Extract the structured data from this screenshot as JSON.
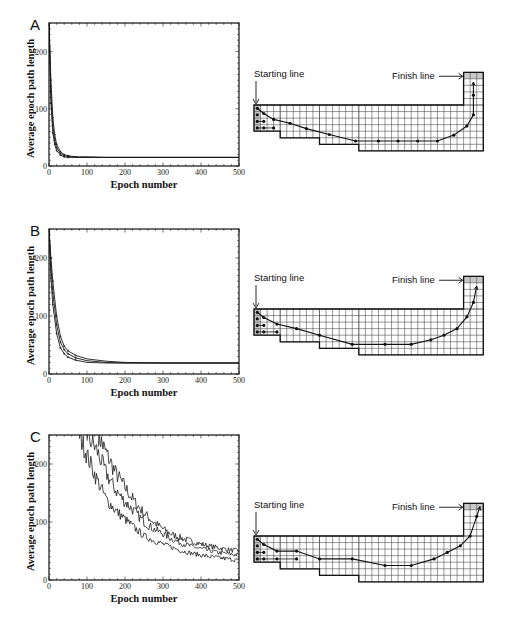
{
  "figure": {
    "panels": [
      {
        "letter": "A",
        "start_label": "Starting line",
        "finish_label": "Finish line"
      },
      {
        "letter": "B",
        "start_label": "Starting line",
        "finish_label": "Finish line"
      },
      {
        "letter": "C",
        "start_label": "Starting line",
        "finish_label": "Finish line"
      }
    ]
  },
  "chart_data": [
    {
      "type": "line",
      "panel": "A",
      "title": "",
      "xlabel": "Epoch number",
      "ylabel": "Average epoch path length",
      "xlim": [
        0,
        500
      ],
      "ylim": [
        0,
        250
      ],
      "xticks": [
        0,
        100,
        200,
        300,
        400,
        500
      ],
      "yticks": [
        0,
        100,
        200
      ],
      "grid": false,
      "series": [
        {
          "name": "upper",
          "x": [
            0,
            5,
            10,
            15,
            20,
            30,
            40,
            50,
            60,
            80,
            100,
            150,
            200,
            300,
            400,
            500
          ],
          "y": [
            250,
            150,
            85,
            55,
            38,
            25,
            20,
            18,
            17,
            16,
            16,
            15,
            15,
            15,
            15,
            15
          ]
        },
        {
          "name": "middle",
          "x": [
            0,
            5,
            10,
            15,
            20,
            30,
            40,
            50,
            60,
            80,
            100,
            150,
            200,
            300,
            400,
            500
          ],
          "y": [
            250,
            130,
            70,
            45,
            32,
            22,
            18,
            17,
            16,
            15,
            15,
            15,
            15,
            15,
            15,
            15
          ]
        },
        {
          "name": "lower",
          "x": [
            0,
            5,
            10,
            15,
            20,
            30,
            40,
            50,
            60,
            80,
            100,
            150,
            200,
            300,
            400,
            500
          ],
          "y": [
            250,
            110,
            58,
            38,
            27,
            19,
            16,
            15,
            15,
            15,
            15,
            15,
            15,
            15,
            15,
            15
          ]
        }
      ]
    },
    {
      "type": "line",
      "panel": "B",
      "title": "",
      "xlabel": "Epoch number",
      "ylabel": "Average epoch path length",
      "xlim": [
        0,
        500
      ],
      "ylim": [
        0,
        250
      ],
      "xticks": [
        0,
        100,
        200,
        300,
        400,
        500
      ],
      "yticks": [
        0,
        100,
        200
      ],
      "grid": false,
      "series": [
        {
          "name": "upper",
          "x": [
            0,
            5,
            10,
            20,
            30,
            40,
            50,
            70,
            100,
            150,
            200,
            300,
            400,
            500
          ],
          "y": [
            250,
            200,
            160,
            100,
            65,
            48,
            40,
            32,
            26,
            22,
            20,
            19,
            19,
            19
          ]
        },
        {
          "name": "middle",
          "x": [
            0,
            5,
            10,
            20,
            30,
            40,
            50,
            70,
            100,
            150,
            200,
            300,
            400,
            500
          ],
          "y": [
            250,
            185,
            140,
            85,
            55,
            42,
            35,
            28,
            23,
            20,
            19,
            19,
            19,
            19
          ]
        },
        {
          "name": "lower",
          "x": [
            0,
            5,
            10,
            20,
            30,
            40,
            50,
            70,
            100,
            150,
            200,
            300,
            400,
            500
          ],
          "y": [
            250,
            165,
            120,
            70,
            45,
            35,
            29,
            24,
            20,
            19,
            19,
            19,
            19,
            19
          ]
        }
      ]
    },
    {
      "type": "line",
      "panel": "C",
      "title": "",
      "xlabel": "Epoch number",
      "ylabel": "Average epoch path length",
      "xlim": [
        0,
        500
      ],
      "ylim": [
        0,
        250
      ],
      "xticks": [
        0,
        100,
        200,
        300,
        400,
        500
      ],
      "yticks": [
        0,
        100,
        200
      ],
      "grid": false,
      "series": [
        {
          "name": "upper",
          "x": [
            130,
            150,
            175,
            200,
            225,
            250,
            275,
            300,
            325,
            350,
            375,
            400,
            425,
            450,
            475,
            500
          ],
          "y": [
            250,
            220,
            185,
            160,
            135,
            115,
            100,
            88,
            78,
            72,
            67,
            62,
            58,
            55,
            52,
            50
          ]
        },
        {
          "name": "middle",
          "x": [
            100,
            125,
            150,
            175,
            200,
            225,
            250,
            275,
            300,
            325,
            350,
            375,
            400,
            425,
            450,
            475,
            500
          ],
          "y": [
            250,
            225,
            185,
            155,
            135,
            118,
            100,
            88,
            80,
            70,
            63,
            58,
            54,
            50,
            47,
            45,
            43
          ]
        },
        {
          "name": "lower",
          "x": [
            80,
            100,
            125,
            150,
            175,
            200,
            225,
            250,
            275,
            300,
            325,
            350,
            375,
            400,
            425,
            450,
            475,
            500
          ],
          "y": [
            250,
            215,
            175,
            140,
            120,
            105,
            90,
            76,
            68,
            62,
            56,
            50,
            46,
            43,
            40,
            38,
            36,
            34
          ]
        }
      ]
    }
  ],
  "racetracks": [
    {
      "panel": "A",
      "path": [
        [
          0.5,
          0.5
        ],
        [
          1.5,
          1.3
        ],
        [
          3,
          2.2
        ],
        [
          5.5,
          2.8
        ],
        [
          8,
          3.6
        ],
        [
          11.5,
          4.5
        ],
        [
          15.5,
          5.5
        ],
        [
          19,
          5.5
        ],
        [
          22,
          5.5
        ],
        [
          25,
          5.5
        ],
        [
          28,
          5.5
        ],
        [
          30.5,
          4.6
        ],
        [
          32.5,
          3.2
        ],
        [
          33.5,
          1.5
        ],
        [
          33.5,
          -1.5
        ],
        [
          33.5,
          -3.5
        ]
      ],
      "start_dots": [
        [
          0.5,
          1.5
        ],
        [
          0.5,
          2.5
        ],
        [
          0.5,
          3.5
        ],
        [
          1.5,
          2.5
        ],
        [
          1.5,
          3.5
        ],
        [
          3,
          3.5
        ]
      ]
    },
    {
      "panel": "B",
      "path": [
        [
          0.5,
          0.5
        ],
        [
          1.5,
          1.3
        ],
        [
          3.5,
          2.3
        ],
        [
          6.5,
          3.0
        ],
        [
          10,
          4.0
        ],
        [
          15,
          5.4
        ],
        [
          20,
          5.4
        ],
        [
          24,
          5.4
        ],
        [
          27,
          4.7
        ],
        [
          29,
          4.0
        ],
        [
          31,
          3.0
        ],
        [
          32.5,
          1.2
        ],
        [
          33.5,
          -1.0
        ],
        [
          34,
          -3.5
        ]
      ],
      "start_dots": [
        [
          0.5,
          1.5
        ],
        [
          0.5,
          2.5
        ],
        [
          0.5,
          3.5
        ],
        [
          1.5,
          2.5
        ],
        [
          1.5,
          3.5
        ],
        [
          3.5,
          3.5
        ]
      ]
    },
    {
      "panel": "C",
      "path": [
        [
          0.5,
          0.5
        ],
        [
          1.5,
          1.3
        ],
        [
          3.5,
          2.3
        ],
        [
          6.5,
          2.3
        ],
        [
          10,
          3.5
        ],
        [
          15,
          3.5
        ],
        [
          20,
          4.5
        ],
        [
          24,
          4.5
        ],
        [
          27.5,
          3.5
        ],
        [
          29.5,
          2.5
        ],
        [
          31.5,
          1.5
        ],
        [
          33,
          0
        ],
        [
          34,
          -3
        ],
        [
          34.5,
          -4.5
        ]
      ],
      "start_dots": [
        [
          0.5,
          1.5
        ],
        [
          0.5,
          2.5
        ],
        [
          0.5,
          3.5
        ],
        [
          1.5,
          2.5
        ],
        [
          1.5,
          3.5
        ],
        [
          3.5,
          3.5
        ],
        [
          6.5,
          3.5
        ]
      ]
    }
  ]
}
